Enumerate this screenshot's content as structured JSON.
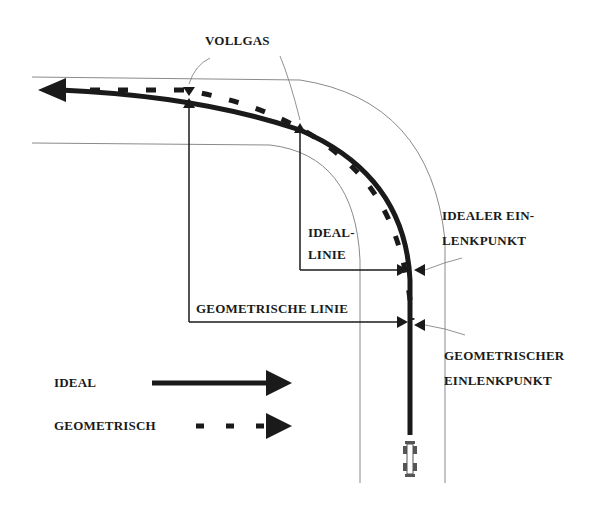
{
  "diagram": {
    "labels": {
      "vollgas": "VOLLGAS",
      "ideal_linie_1": "IDEAL-",
      "ideal_linie_2": "LINIE",
      "geometrische_linie": "GEOMETRISCHE LINIE",
      "idealer_einlenkpunkt_1": "IDEALER EIN-",
      "idealer_einlenkpunkt_2": "LENKPUNKT",
      "geometrischer_einlenkpunkt_1": "GEOMETRISCHER",
      "geometrischer_einlenkpunkt_2": "EINLENKPUNKT"
    },
    "legend": {
      "ideal": "IDEAL",
      "geometrisch": "GEOMETRISCH"
    },
    "colors": {
      "line": "#1a1a1a",
      "road_edge": "#8a8a8a",
      "background": "#ffffff"
    }
  }
}
